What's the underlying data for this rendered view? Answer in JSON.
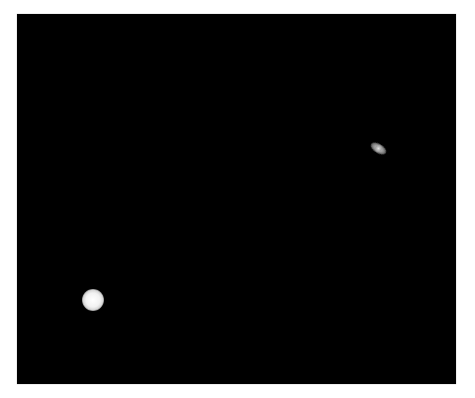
{
  "image": {
    "description": "Night sky photograph showing two planets against a black background",
    "background_color": "#000000",
    "page_background": "#ffffff",
    "objects": [
      {
        "name": "bright-planet",
        "label": "Bright planet (likely Jupiter)",
        "color": "#f2f2f2",
        "position": "lower-left"
      },
      {
        "name": "ringed-planet",
        "label": "Ringed planet (likely Saturn)",
        "color": "#9a9a9a",
        "position": "upper-right"
      }
    ]
  }
}
